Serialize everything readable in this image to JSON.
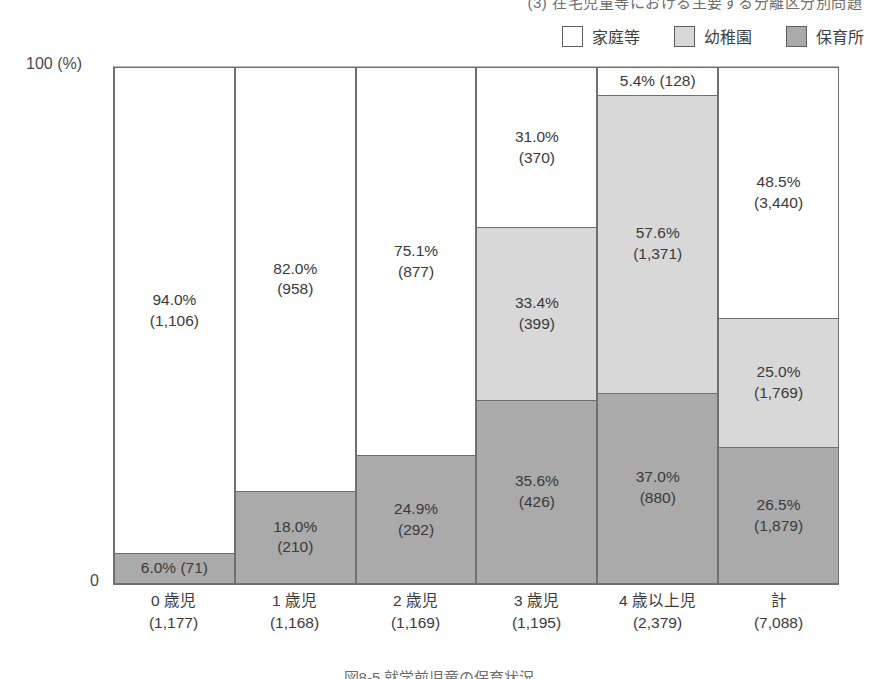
{
  "captions": {
    "top": "(3) 在宅児童等における主要する分離区分別問題",
    "bottom": "図8-5 就学前児童の保育状況"
  },
  "legend": {
    "items": [
      {
        "label": "家庭等",
        "color": "#ffffff",
        "key": "katei"
      },
      {
        "label": "幼稚園",
        "color": "#d8d8d8",
        "key": "youchi"
      },
      {
        "label": "保育所",
        "color": "#aaaaaa",
        "key": "hoiku"
      }
    ]
  },
  "axis": {
    "top_label": "100 (%)",
    "zero_label": "0"
  },
  "chart_data": {
    "type": "bar",
    "stacked": true,
    "title": "就学前児童の保育状況",
    "xlabel": "",
    "ylabel": "(%)",
    "ylim": [
      0,
      100
    ],
    "grid": false,
    "legend_position": "top-right",
    "categories": [
      "0 歳児",
      "1 歳児",
      "2 歳児",
      "3 歳児",
      "4 歳以上児",
      "計"
    ],
    "category_totals": [
      "1,177",
      "1,168",
      "1,169",
      "1,195",
      "2,379",
      "7,088"
    ],
    "category_labels": [
      "0 歳児\n(1,177)",
      "1 歳児\n(1,168)",
      "2 歳児\n(1,169)",
      "3 歳児\n(1,195)",
      "4 歳以上児\n(2,379)",
      "計\n(7,088)"
    ],
    "series": [
      {
        "name": "家庭等",
        "color": "#ffffff",
        "values": [
          94.0,
          82.0,
          75.1,
          31.0,
          5.4,
          48.5
        ],
        "counts": [
          1106,
          958,
          877,
          370,
          128,
          3440
        ],
        "labels": [
          "94.0%\n(1,106)",
          "82.0%\n(958)",
          "75.1%\n(877)",
          "31.0%\n(370)",
          "5.4% (128)",
          "48.5%\n(3,440)"
        ]
      },
      {
        "name": "幼稚園",
        "color": "#d8d8d8",
        "values": [
          0,
          0,
          0,
          33.4,
          57.6,
          25.0
        ],
        "counts": [
          0,
          0,
          0,
          399,
          1371,
          1769
        ],
        "labels": [
          "",
          "",
          "",
          "33.4%\n(399)",
          "57.6%\n(1,371)",
          "25.0%\n(1,769)"
        ]
      },
      {
        "name": "保育所",
        "color": "#aaaaaa",
        "values": [
          6.0,
          18.0,
          24.9,
          35.6,
          37.0,
          26.5
        ],
        "counts": [
          71,
          210,
          292,
          426,
          880,
          1879
        ],
        "labels": [
          "6.0% (71)",
          "18.0%\n(210)",
          "24.9%\n(292)",
          "35.6%\n(426)",
          "37.0%\n(880)",
          "26.5%\n(1,879)"
        ]
      }
    ]
  }
}
